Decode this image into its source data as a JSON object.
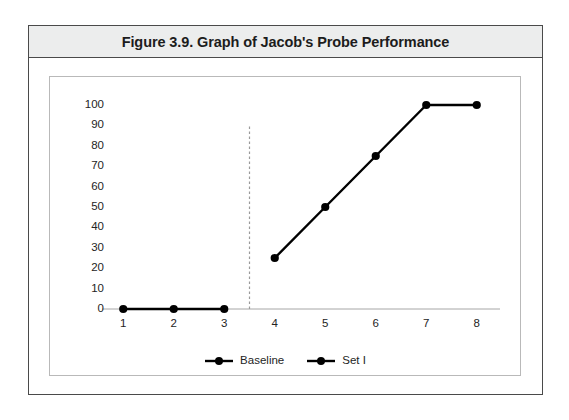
{
  "figure": {
    "title": "Figure 3.9. Graph of Jacob's Probe Performance"
  },
  "chart_data": {
    "type": "line",
    "title": "Figure 3.9. Graph of Jacob's Probe Performance",
    "xlabel": "",
    "ylabel": "",
    "x": [
      1,
      2,
      3,
      4,
      5,
      6,
      7,
      8
    ],
    "xticklabels": [
      "1",
      "2",
      "3",
      "4",
      "5",
      "6",
      "7",
      "8"
    ],
    "yticklabels": [
      "0",
      "10",
      "20",
      "30",
      "40",
      "50",
      "60",
      "70",
      "80",
      "90",
      "100"
    ],
    "yticks": [
      0,
      10,
      20,
      30,
      40,
      50,
      60,
      70,
      80,
      90,
      100
    ],
    "ylim": [
      0,
      100
    ],
    "xlim": [
      0.5,
      8.5
    ],
    "grid": false,
    "legend_position": "bottom-center",
    "series": [
      {
        "name": "Baseline",
        "color": "#000000",
        "marker": "circle",
        "x": [
          1,
          2,
          3
        ],
        "values": [
          0,
          0,
          0
        ]
      },
      {
        "name": "Set I",
        "color": "#000000",
        "marker": "circle",
        "x": [
          4,
          5,
          6,
          7,
          8
        ],
        "values": [
          25,
          50,
          75,
          100,
          100
        ]
      }
    ],
    "annotations": [
      {
        "type": "phase-line",
        "style": "dashed",
        "color": "#9a9a9a",
        "x": 3.5,
        "y_from": 0,
        "y_to": 90
      }
    ]
  },
  "legend": {
    "items": [
      {
        "label": "Baseline",
        "color": "#000000"
      },
      {
        "label": "Set I",
        "color": "#000000"
      }
    ]
  },
  "colors": {
    "series": "#000000",
    "axis": "#a6a6a6",
    "phase_line": "#9a9a9a",
    "title_band": "#eceded",
    "frame": "#4a4a4a",
    "panel_border": "#b9b9b9",
    "background": "#ffffff",
    "text": "#242424"
  }
}
